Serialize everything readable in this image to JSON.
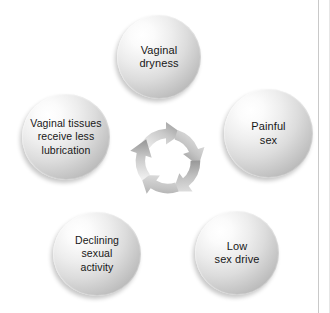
{
  "diagram": {
    "type": "cycle",
    "direction": "clockwise",
    "node_count": 5,
    "nodes": [
      {
        "id": "vaginal-dryness",
        "label": "Vaginal\ndryness",
        "position": "top"
      },
      {
        "id": "painful-sex",
        "label": "Painful\nsex",
        "position": "right"
      },
      {
        "id": "low-sex-drive",
        "label": "Low\nsex drive",
        "position": "bottom-right"
      },
      {
        "id": "declining-sexual-activity",
        "label": "Declining sexual\nactivity",
        "position": "bottom-left"
      },
      {
        "id": "vaginal-tissues-less-lubrication",
        "label": "Vaginal tissues\nreceive less\nlubrication",
        "position": "left"
      }
    ],
    "center": {
      "name": "cycle-arrows",
      "arrow_count": 5,
      "direction": "clockwise"
    },
    "colors": {
      "sphere_highlight": "#ffffff",
      "sphere_mid": "#dcdcdc",
      "sphere_shadow": "#a8a8a8",
      "arrow_light": "#efefef",
      "arrow_dark": "#9a9a9a",
      "text": "#171717",
      "background": "#ffffff",
      "frame_rule": "#c9c9c9"
    }
  }
}
